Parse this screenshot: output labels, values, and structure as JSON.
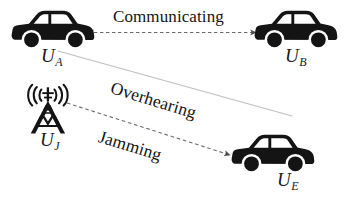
{
  "diagram": {
    "background_color": "#ffffff",
    "ink_color": "#141414",
    "width": 347,
    "height": 201,
    "nodes": [
      {
        "id": "UA",
        "icon": "car-icon",
        "base": "U",
        "subscript": "A",
        "label": "U_A",
        "role": "transmitting vehicle"
      },
      {
        "id": "UB",
        "icon": "car-icon",
        "base": "U",
        "subscript": "B",
        "label": "U_B",
        "role": "receiving vehicle"
      },
      {
        "id": "UJ",
        "icon": "radio-tower-icon",
        "base": "U",
        "subscript": "J",
        "label": "U_J",
        "role": "jammer tower"
      },
      {
        "id": "UE",
        "icon": "car-icon",
        "base": "U",
        "subscript": "E",
        "label": "U_E",
        "role": "eavesdropping vehicle"
      }
    ],
    "edges": [
      {
        "id": "communicating",
        "label": "Communicating",
        "from": "UA",
        "to": "UB",
        "style": "dashed",
        "arrows": "both",
        "color": "#5a5a5a"
      },
      {
        "id": "overhearing",
        "label": "Overhearing",
        "from": "UA",
        "to": "UE",
        "style": "solid",
        "arrows": "none",
        "color": "#b8b8b8"
      },
      {
        "id": "jamming",
        "label": "Jamming",
        "from": "UJ",
        "to": "UE",
        "style": "dashed",
        "arrows": "end",
        "color": "#5a5a5a"
      }
    ]
  }
}
